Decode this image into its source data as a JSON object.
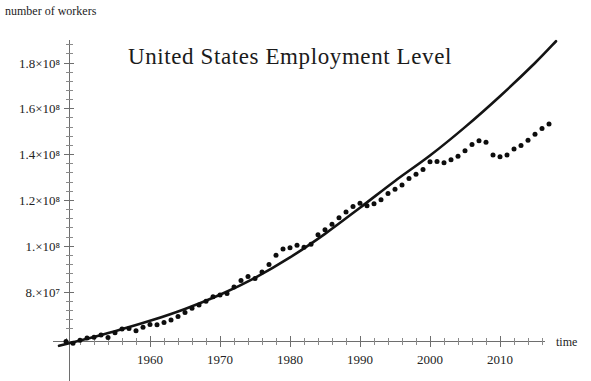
{
  "figure": {
    "title": "United States Employment Level",
    "y_axis_label": "number of workers",
    "x_axis_label": "time",
    "background_color": "#ffffff",
    "curve_color": "#141414",
    "point_color": "#0d0d0d",
    "axis_color": "#6e6e6e"
  },
  "chart_data": {
    "type": "scatter",
    "title": "United States Employment Level",
    "xlabel": "time",
    "ylabel": "number of workers",
    "grid": false,
    "legend": null,
    "xlim": [
      1947,
      2019
    ],
    "ylim": [
      64000000,
      192000000
    ],
    "x_tick_labels": [
      "1960",
      "1970",
      "1980",
      "1990",
      "2000",
      "2010"
    ],
    "x_tick_values": [
      1960,
      1970,
      1980,
      1990,
      2000,
      2010
    ],
    "x_minor_tick_step": 2,
    "y_tick_labels": [
      "8.×10⁷",
      "1.×10⁸",
      "1.2×10⁸",
      "1.4×10⁸",
      "1.6×10⁸",
      "1.8×10⁸"
    ],
    "y_tick_values": [
      80000000,
      100000000,
      120000000,
      140000000,
      160000000,
      180000000
    ],
    "y_minor_tick_step": 4000000,
    "series": [
      {
        "name": "observed employment",
        "type": "scatter",
        "marker": "filled-circle",
        "x": [
          1948,
          1949,
          1950,
          1951,
          1952,
          1953,
          1954,
          1955,
          1956,
          1957,
          1958,
          1959,
          1960,
          1961,
          1962,
          1963,
          1964,
          1965,
          1966,
          1967,
          1968,
          1969,
          1970,
          1971,
          1972,
          1973,
          1974,
          1975,
          1976,
          1977,
          1978,
          1979,
          1980,
          1981,
          1982,
          1983,
          1984,
          1985,
          1986,
          1987,
          1988,
          1989,
          1990,
          1991,
          1992,
          1993,
          1994,
          1995,
          1996,
          1997,
          1998,
          1999,
          2000,
          2001,
          2002,
          2003,
          2004,
          2005,
          2006,
          2007,
          2008,
          2009,
          2010,
          2011,
          2012,
          2013,
          2014,
          2015,
          2016,
          2017
        ],
        "y": [
          58343000,
          57651000,
          58918000,
          59961000,
          60250000,
          61179000,
          60109000,
          62170000,
          63799000,
          64071000,
          63036000,
          64630000,
          65778000,
          65746000,
          66702000,
          67762000,
          69305000,
          71088000,
          72895000,
          74372000,
          75920000,
          77902000,
          78678000,
          79367000,
          82153000,
          85064000,
          86794000,
          85846000,
          88752000,
          92017000,
          96048000,
          98824000,
          99303000,
          100397000,
          99526000,
          100834000,
          105005000,
          107150000,
          109597000,
          112440000,
          114968000,
          117342000,
          118793000,
          117718000,
          118492000,
          120259000,
          123060000,
          124900000,
          126708000,
          129558000,
          131463000,
          133488000,
          136891000,
          136933000,
          136485000,
          137736000,
          139252000,
          141730000,
          144427000,
          146047000,
          145362000,
          139877000,
          139064000,
          139869000,
          142469000,
          143929000,
          146305000,
          148834000,
          151436000,
          153337000
        ],
        "annotation": "annual U.S. employment level, dots"
      },
      {
        "name": "fitted exponential model",
        "type": "line",
        "style": "solid",
        "x": [
          1947,
          1950,
          1955,
          1960,
          1965,
          1970,
          1975,
          1980,
          1985,
          1990,
          1995,
          2000,
          2005,
          2010,
          2015,
          2018
        ],
        "y": [
          56500000,
          58800000,
          62900000,
          67400000,
          72600000,
          78800000,
          86200000,
          95100000,
          105400000,
          116800000,
          128500000,
          139600000,
          152000000,
          165500000,
          180000000,
          189500000
        ],
        "annotation": "smooth growth model curve that overshoots the data after 2000"
      }
    ],
    "notes": [
      "Data points track the fitted curve closely from 1948 through about 2000.",
      "After 2000 the observed values plateau near 1.4×10⁸ and dip around 2009–2010 while the model keeps rising toward 1.9×10⁸."
    ]
  }
}
